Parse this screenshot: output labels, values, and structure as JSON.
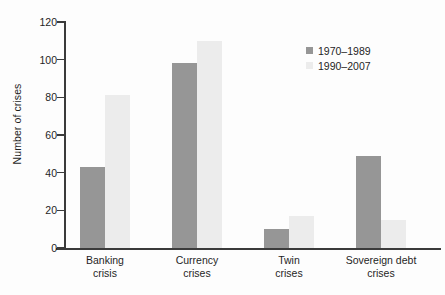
{
  "chart_data": {
    "type": "bar",
    "title": "",
    "subtitle": "",
    "xlabel": "",
    "ylabel": "Number of crises",
    "ylim": [
      0,
      120
    ],
    "yticks": [
      0,
      20,
      40,
      60,
      80,
      100,
      120
    ],
    "ytick_labels": [
      "0",
      "20",
      "40",
      "60",
      "80",
      "100",
      "120"
    ],
    "grid": false,
    "legend_position": "top-right",
    "categories": [
      "Banking\ncrisis",
      "Currency\ncrises",
      "Twin\ncrises",
      "Sovereign debt\ncrises"
    ],
    "category_lines": [
      [
        "Banking",
        "crisis"
      ],
      [
        "Currency",
        "crises"
      ],
      [
        "Twin",
        "crises"
      ],
      [
        "Sovereign debt",
        "crises"
      ]
    ],
    "series": [
      {
        "name": "1970–1989",
        "color": "#969696",
        "values": [
          43,
          98,
          10,
          49
        ]
      },
      {
        "name": "1990–2007",
        "color": "#ececec",
        "values": [
          81,
          110,
          17,
          15
        ]
      }
    ]
  },
  "legend": {
    "entries": [
      {
        "label": "1970–1989",
        "color": "#969696"
      },
      {
        "label": "1990–2007",
        "color": "#ececec"
      }
    ]
  },
  "axes": {
    "y_label": "Number of crises",
    "y_ticks": [
      "120",
      "100",
      "80",
      "60",
      "40",
      "20",
      "0"
    ]
  },
  "colors": {
    "series_dark": "#969696",
    "series_light": "#ececec",
    "axis": "#3b3b3b",
    "text": "#1f1f1f",
    "background": "#fdfdfd"
  }
}
